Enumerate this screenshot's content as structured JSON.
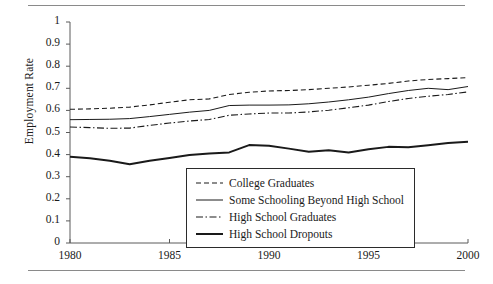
{
  "chart_data": {
    "type": "line",
    "title": "",
    "xlabel": "",
    "ylabel": "Employment Rate",
    "xlim": [
      1980,
      2000
    ],
    "ylim": [
      0,
      1
    ],
    "grid": false,
    "legend_position": "bottom-center-right",
    "x": [
      1980,
      1981,
      1982,
      1983,
      1984,
      1985,
      1986,
      1987,
      1988,
      1989,
      1990,
      1991,
      1992,
      1993,
      1994,
      1995,
      1996,
      1997,
      1998,
      1999,
      2000
    ],
    "xticks": [
      "1980",
      "1985",
      "1990",
      "1995",
      "2000"
    ],
    "yticks": [
      "0",
      "0.1",
      "0.2",
      "0.3",
      "0.4",
      "0.5",
      "0.6",
      "0.7",
      "0.8",
      "0.9",
      "1"
    ],
    "series": [
      {
        "name": "College Graduates",
        "style": "dashed",
        "values": [
          0.605,
          0.607,
          0.61,
          0.615,
          0.625,
          0.637,
          0.648,
          0.652,
          0.672,
          0.682,
          0.688,
          0.69,
          0.694,
          0.7,
          0.706,
          0.714,
          0.722,
          0.733,
          0.74,
          0.744,
          0.748
        ]
      },
      {
        "name": "Some Schooling Beyond High School",
        "style": "solid-thin",
        "values": [
          0.558,
          0.559,
          0.56,
          0.563,
          0.572,
          0.582,
          0.592,
          0.6,
          0.622,
          0.624,
          0.624,
          0.625,
          0.63,
          0.638,
          0.648,
          0.66,
          0.676,
          0.69,
          0.7,
          0.694,
          0.708
        ]
      },
      {
        "name": "High School Graduates",
        "style": "dash-dot",
        "values": [
          0.525,
          0.522,
          0.519,
          0.52,
          0.532,
          0.543,
          0.552,
          0.559,
          0.578,
          0.584,
          0.588,
          0.588,
          0.593,
          0.601,
          0.612,
          0.624,
          0.64,
          0.654,
          0.664,
          0.672,
          0.684
        ]
      },
      {
        "name": "High School Dropouts",
        "style": "solid-thick",
        "values": [
          0.39,
          0.383,
          0.372,
          0.356,
          0.372,
          0.385,
          0.398,
          0.405,
          0.41,
          0.443,
          0.44,
          0.427,
          0.413,
          0.42,
          0.41,
          0.424,
          0.435,
          0.433,
          0.442,
          0.452,
          0.458
        ]
      }
    ]
  },
  "legend": {
    "items": [
      {
        "label": "College Graduates"
      },
      {
        "label": "Some Schooling Beyond High School"
      },
      {
        "label": "High School Graduates"
      },
      {
        "label": "High School Dropouts"
      }
    ]
  },
  "colors": {
    "ink": "#1a1a1a",
    "axis": "#5a5a5a",
    "rule": "#8a8a8a",
    "background": "#ffffff"
  }
}
